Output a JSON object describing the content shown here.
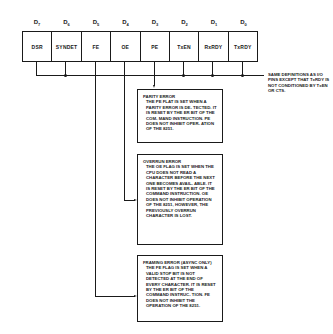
{
  "register": {
    "bits": [
      {
        "label": "D",
        "sub": "7",
        "name": "DSR"
      },
      {
        "label": "D",
        "sub": "6",
        "name": "SYNDET"
      },
      {
        "label": "D",
        "sub": "5",
        "name": "FE"
      },
      {
        "label": "D",
        "sub": "4",
        "name": "OE"
      },
      {
        "label": "D",
        "sub": "3",
        "name": "PE"
      },
      {
        "label": "D",
        "sub": "2",
        "name": "TxEN"
      },
      {
        "label": "D",
        "sub": "1",
        "name": "RxRDY"
      },
      {
        "label": "D",
        "sub": "0",
        "name": "TxRDY"
      }
    ]
  },
  "side_note": "SAME DEFINITIONS AS I/O PINS EXCEPT THAT TxRDY IS NOT CONDITIONED BY TxEN OR CTS.",
  "notes": {
    "parity": {
      "title": "PARITY ERROR",
      "body": "THE PE FLAT IS SET WHEN A PARITY ERROR IS DE- TECTED. IT IS RESET BY THE ER BIT OF THE COM- MAND INSTRUCTION. PE DOES NOT INHIBIT OPER- ATION OF THE 8251."
    },
    "overrun": {
      "title": "OVERRUN ERROR",
      "body": "THE OE FLAG IS SET WHEN THE CPU DOES NOT READ A CHARACTER BEFORE THE NEXT ONE BECOMES AVAIL- ABLE. IT IS RESET BY THE ER BIT OF THE COMMAND INSTRUCTION. OE DOES NOT INHIBIT OPERATION OF THE 8251, HOWEVER, THE PREVIOUSLY OVERRUN CHARACTER IS LOST."
    },
    "framing": {
      "title": "FRAMING ERROR (ASYNC ONLY)",
      "body": "THE FE FLAG IS SET WHEN A VALID STOP BIT IS NOT DETECTED AT THE END OF EVERY CHARACTER. IT IS RESET BY THE ER BIT OF THE COMMAND INSTRUC- TION. FE DOES NOT INHIBIT THE OPERATION OF THE 8251."
    }
  }
}
